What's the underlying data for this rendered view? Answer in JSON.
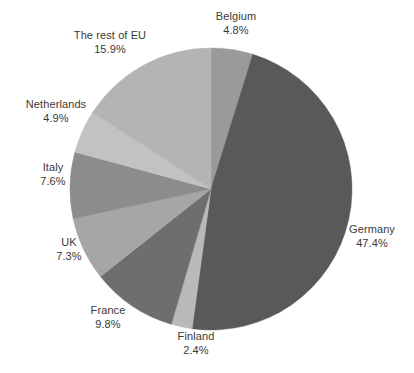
{
  "chart_data": {
    "type": "pie",
    "title": "",
    "subtitle": "",
    "xlabel": "",
    "ylabel": "",
    "legend_position": "none",
    "grid": false,
    "units": "%",
    "start_angle_deg": 0,
    "direction": "clockwise",
    "categories": [
      "Belgium",
      "Germany",
      "Finland",
      "France",
      "UK",
      "Italy",
      "Netherlands",
      "The rest of EU"
    ],
    "values": [
      4.8,
      47.4,
      2.4,
      9.8,
      7.3,
      7.6,
      4.9,
      15.9
    ],
    "slices": [
      {
        "label": "Belgium",
        "value": 4.8,
        "value_text": "4.8%",
        "color": "#9a9a9a"
      },
      {
        "label": "Germany",
        "value": 47.4,
        "value_text": "47.4%",
        "color": "#595959"
      },
      {
        "label": "Finland",
        "value": 2.4,
        "value_text": "2.4%",
        "color": "#b9b9b9"
      },
      {
        "label": "France",
        "value": 9.8,
        "value_text": "9.8%",
        "color": "#6e6e6e"
      },
      {
        "label": "UK",
        "value": 7.3,
        "value_text": "7.3%",
        "color": "#a6a6a6"
      },
      {
        "label": "Italy",
        "value": 7.6,
        "value_text": "7.6%",
        "color": "#8c8c8c"
      },
      {
        "label": "Netherlands",
        "value": 4.9,
        "value_text": "4.9%",
        "color": "#c2c2c2"
      },
      {
        "label": "The rest of EU",
        "value": 15.9,
        "value_text": "15.9%",
        "color": "#b4b4b4"
      }
    ]
  },
  "labels": {
    "belgium": {
      "name": "Belgium",
      "value": "4.8%"
    },
    "germany": {
      "name": "Germany",
      "value": "47.4%"
    },
    "finland": {
      "name": "Finland",
      "value": "2.4%"
    },
    "france": {
      "name": "France",
      "value": "9.8%"
    },
    "uk": {
      "name": "UK",
      "value": "7.3%"
    },
    "italy": {
      "name": "Italy",
      "value": "7.6%"
    },
    "netherlands": {
      "name": "Netherlands",
      "value": "4.9%"
    },
    "rest_of_eu": {
      "name": "The rest of EU",
      "value": "15.9%"
    }
  },
  "geometry": {
    "center_x": 211,
    "center_y": 189,
    "radius": 141
  },
  "colors": {
    "background": "#ffffff",
    "label_text": "#3a3a3a"
  }
}
